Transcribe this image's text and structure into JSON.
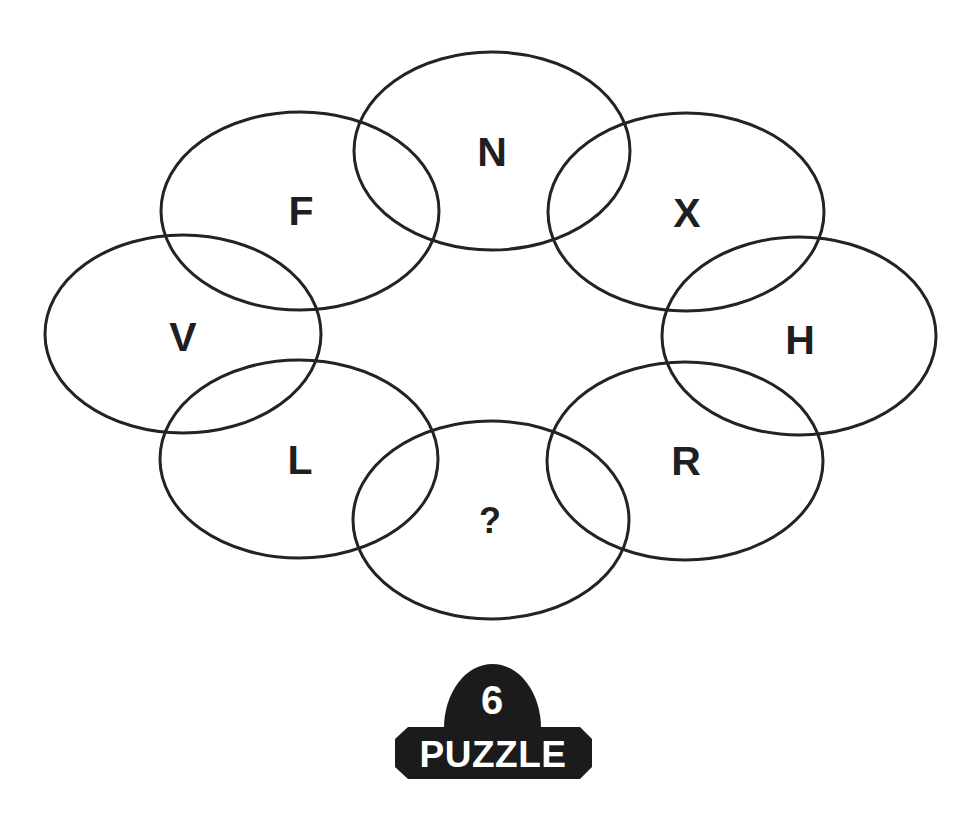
{
  "puzzle": {
    "rings": [
      {
        "id": "n",
        "letter": "N",
        "cx": 492,
        "cy": 151,
        "rx": 138,
        "ry": 99
      },
      {
        "id": "x",
        "letter": "X",
        "cx": 686,
        "cy": 212,
        "rx": 138,
        "ry": 99
      },
      {
        "id": "h",
        "letter": "H",
        "cx": 799,
        "cy": 336,
        "rx": 137,
        "ry": 99
      },
      {
        "id": "r",
        "letter": "R",
        "cx": 685,
        "cy": 461,
        "rx": 138,
        "ry": 99
      },
      {
        "id": "unknown",
        "letter": "?",
        "cx": 491,
        "cy": 520,
        "rx": 138,
        "ry": 99
      },
      {
        "id": "l",
        "letter": "L",
        "cx": 299,
        "cy": 459,
        "rx": 139,
        "ry": 99
      },
      {
        "id": "v",
        "letter": "V",
        "cx": 183,
        "cy": 334,
        "rx": 138,
        "ry": 99
      },
      {
        "id": "f",
        "letter": "F",
        "cx": 300,
        "cy": 211,
        "rx": 139,
        "ry": 99
      }
    ],
    "letters": {
      "n": "N",
      "x": "X",
      "h": "H",
      "r": "R",
      "unknown": "?",
      "l": "L",
      "v": "V",
      "f": "F"
    }
  },
  "badge": {
    "number": "6",
    "label": "PUZZLE",
    "color": "#1b1b1b",
    "text_color": "#ffffff"
  },
  "colors": {
    "stroke": "#232323",
    "letters": "#1f1f1f",
    "background": "#ffffff"
  }
}
